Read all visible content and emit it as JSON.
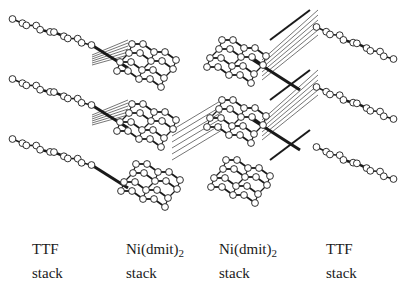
{
  "figure": {
    "layers": 3
  },
  "labels": [
    {
      "name": "TTF",
      "sub": "",
      "line2": "stack",
      "x": 32
    },
    {
      "name": "Ni(dmit)",
      "sub": "2",
      "line2": "stack",
      "x": 126
    },
    {
      "name": "Ni(dmit)",
      "sub": "2",
      "line2": "stack",
      "x": 219
    },
    {
      "name": "TTF",
      "sub": "",
      "line2": "stack",
      "x": 326
    }
  ],
  "colors": {
    "ink": "#1a1a1a",
    "atom_fill": "#ffffff",
    "background": "#ffffff"
  }
}
